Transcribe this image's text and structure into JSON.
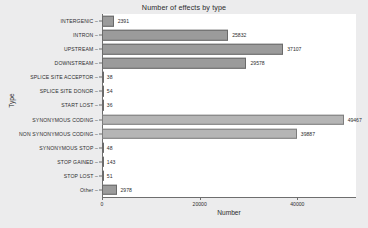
{
  "chart_data": {
    "type": "bar",
    "orientation": "horizontal",
    "title": "Number of effects by type",
    "xlabel": "Number",
    "ylabel": "Type",
    "xlim": [
      0,
      52000
    ],
    "xticks": [
      0,
      20000,
      40000
    ],
    "xticklabels": [
      "0",
      "20000",
      "40000"
    ],
    "grid": false,
    "legend": null,
    "categories": [
      "INTERGENIC",
      "INTRON",
      "UPSTREAM",
      "DOWNSTREAM",
      "SPLICE SITE ACCEPTOR",
      "SPLICE SITE DONOR",
      "START LOST",
      "SYNONYMOUS CODING",
      "NON SYNONYMOUS CODING",
      "SYNONYMOUS STOP",
      "STOP GAINED",
      "STOP LOST",
      "Other"
    ],
    "values": [
      2391,
      25832,
      37107,
      29578,
      38,
      54,
      36,
      49467,
      39887,
      48,
      143,
      51,
      2978
    ],
    "value_labels": [
      "2391",
      "25832",
      "37107",
      "29578",
      "38",
      "54",
      "36",
      "49467",
      "39887",
      "48",
      "143",
      "51",
      "2978"
    ],
    "bar_color": "#9b9b9b",
    "bar_color_alt": "#b5b5b5",
    "bar_edge_color": "#6a6a6a",
    "panel_background": "#ffffff",
    "figure_background": "#ececed",
    "axis_color": "#6e6e6e"
  }
}
